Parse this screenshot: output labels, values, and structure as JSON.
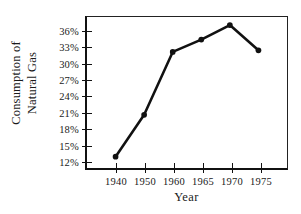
{
  "chart_data": {
    "type": "line",
    "title": "",
    "xlabel": "Year",
    "ylabel_lines": [
      "Consumption of",
      "Natural Gas"
    ],
    "ylabel": "Consumption of Natural Gas",
    "categories": [
      "1940",
      "1950",
      "1960",
      "1965",
      "1970",
      "1975"
    ],
    "values": [
      12.5,
      20.3,
      32.0,
      34.3,
      37.0,
      32.3
    ],
    "x_tick_labels": [
      "1940",
      "1950",
      "1960",
      "1965",
      "1970",
      "1975"
    ],
    "y_tick_labels": [
      "12%",
      "15%",
      "18%",
      "21%",
      "24%",
      "27%",
      "30%",
      "33%",
      "36%"
    ],
    "y_tick_values": [
      12,
      15,
      18,
      21,
      24,
      27,
      30,
      33,
      36
    ],
    "ylim": [
      10.4,
      38.5
    ],
    "grid": false,
    "legend": null,
    "marker": "filled-circle",
    "line_color": "#111111",
    "marker_color": "#111111",
    "background_color": "#ffffff"
  }
}
